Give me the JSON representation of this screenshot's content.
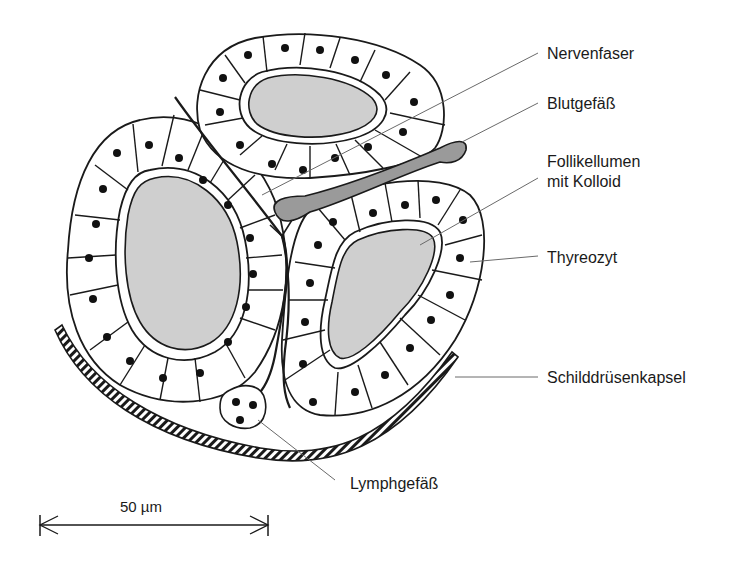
{
  "diagram": {
    "type": "histology-schematic",
    "labels": [
      {
        "id": "nervenfaser",
        "text": "Nervenfaser"
      },
      {
        "id": "blutgefaess",
        "text": "Blutgefäß"
      },
      {
        "id": "follikellumen_1",
        "text": "Follikellumen"
      },
      {
        "id": "follikellumen_2",
        "text": "mit Kolloid"
      },
      {
        "id": "thyreozyt",
        "text": "Thyreozyt"
      },
      {
        "id": "kapsel",
        "text": "Schilddrüsenkapsel"
      },
      {
        "id": "lymphgefaess",
        "text": "Lymphgefäß"
      }
    ],
    "scale_bar": {
      "text": "50 µm"
    },
    "colors": {
      "line": "#1a1a1a",
      "colloid": "#cfcfcf",
      "blood_vessel": "#9a9a9a",
      "leader": "#6a6a6a",
      "background": "#ffffff"
    }
  }
}
